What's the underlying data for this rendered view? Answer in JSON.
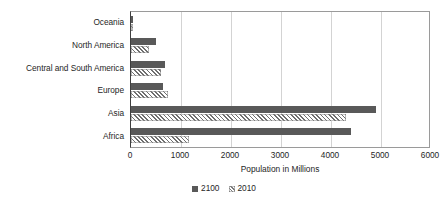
{
  "chart_data": {
    "type": "bar",
    "orientation": "horizontal",
    "title": "",
    "xlabel": "Population in Millions",
    "ylabel": "",
    "xlim": [
      0,
      6000
    ],
    "xticks": [
      0,
      1000,
      2000,
      3000,
      4000,
      5000,
      6000
    ],
    "xtick_labels": [
      "0",
      "1000",
      "2000",
      "3000",
      "4000",
      "5000",
      "6000"
    ],
    "grid": "vertical",
    "legend_position": "bottom",
    "categories": [
      "Oceania",
      "North America",
      "Central and South America",
      "Europe",
      "Asia",
      "Africa"
    ],
    "series": [
      {
        "name": "2100",
        "color": "#595959",
        "pattern": "solid",
        "values": [
          40,
          500,
          670,
          640,
          4900,
          4400
        ]
      },
      {
        "name": "2010",
        "color": "#6e6e6e",
        "pattern": "diagonal-hatch",
        "values": [
          37,
          350,
          590,
          740,
          4300,
          1150
        ]
      }
    ]
  },
  "legend": {
    "items": [
      {
        "label": "2100",
        "swatch": "solid-gray-square"
      },
      {
        "label": "2010",
        "swatch": "hatched-gray-square"
      }
    ]
  }
}
